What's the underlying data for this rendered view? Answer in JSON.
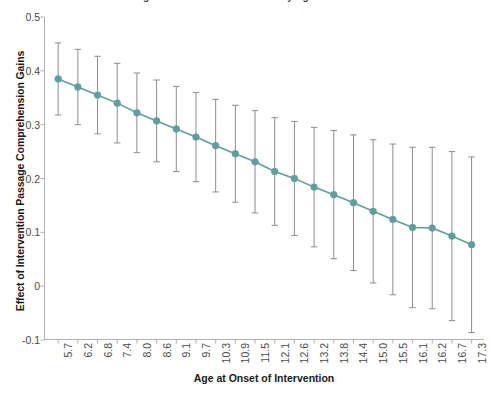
{
  "figure": {
    "title_cropped": "Figure 3. Effect of Intervention by Age at Onset",
    "background_color": "#ffffff"
  },
  "colors": {
    "marker": "#5f9ea0",
    "line": "#5f9ea0",
    "errorbar": "#8c8c8c",
    "axis": "#b0b0b0",
    "tick_label": "#4a4a4a",
    "axis_title": "#1a1a1a"
  },
  "chart_data": {
    "type": "line",
    "title": "Figure 3. Effect of Intervention by Age at Onset",
    "xlabel": "Age at Onset of Intervention",
    "ylabel": "Effect of Intervention Passage Comprehension Gains",
    "grid": false,
    "legend": false,
    "ylim": [
      -0.1,
      0.5
    ],
    "yticks": [
      0.5,
      0.4,
      0.3,
      0.2,
      0.1,
      0,
      -0.1
    ],
    "ytick_labels": [
      "0.5",
      "0.4",
      "0.3",
      "0.2",
      "0.1",
      "0",
      "-0.1"
    ],
    "categories": [
      "5.7",
      "6.2",
      "6.8",
      "7.4",
      "8.0",
      "8.6",
      "9.1",
      "9.7",
      "10.3",
      "10.9",
      "11.5",
      "12.1",
      "12.6",
      "13.2",
      "13.8",
      "14.4",
      "15.0",
      "15.5",
      "16.1",
      "16.2",
      "16.7",
      "17.3"
    ],
    "series": [
      {
        "name": "Effect of Intervention",
        "marker": "circle",
        "values": [
          0.385,
          0.37,
          0.355,
          0.34,
          0.322,
          0.307,
          0.292,
          0.277,
          0.261,
          0.246,
          0.231,
          0.213,
          0.2,
          0.184,
          0.17,
          0.155,
          0.139,
          0.124,
          0.109,
          0.108,
          0.093,
          0.077
        ],
        "error_low": [
          0.318,
          0.3,
          0.283,
          0.266,
          0.248,
          0.231,
          0.213,
          0.194,
          0.175,
          0.156,
          0.136,
          0.113,
          0.094,
          0.073,
          0.051,
          0.029,
          0.006,
          -0.016,
          -0.04,
          -0.042,
          -0.064,
          -0.086
        ],
        "error_high": [
          0.452,
          0.44,
          0.427,
          0.414,
          0.396,
          0.383,
          0.371,
          0.36,
          0.347,
          0.336,
          0.326,
          0.313,
          0.306,
          0.295,
          0.289,
          0.281,
          0.272,
          0.264,
          0.258,
          0.258,
          0.25,
          0.24
        ]
      }
    ]
  }
}
